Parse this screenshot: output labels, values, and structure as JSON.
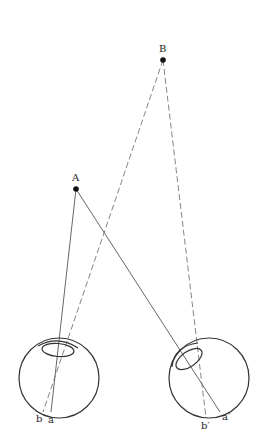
{
  "diagram": {
    "type": "binocular-vision-geometry",
    "points": {
      "A": {
        "label": "A",
        "x": 76,
        "y": 189
      },
      "B": {
        "label": "B",
        "x": 163,
        "y": 60
      }
    },
    "eyes": {
      "left": {
        "center": [
          59,
          378
        ],
        "radius": 40,
        "pupil": {
          "cx": 58,
          "cy": 349,
          "rx": 17,
          "ry": 7,
          "rotate": 5
        },
        "retina_labels": {
          "b": "b",
          "a": "a"
        }
      },
      "right": {
        "center": [
          209,
          378
        ],
        "radius": 40,
        "pupil": {
          "cx": 190,
          "cy": 359,
          "rx": 16,
          "ry": 8,
          "rotate": -35
        },
        "retina_labels": {
          "b": "b′",
          "a": "a′"
        }
      }
    },
    "lines": [
      {
        "from": "A",
        "to": "a",
        "style": "solid"
      },
      {
        "from": "A",
        "to": "a′",
        "style": "solid"
      },
      {
        "from": "B",
        "to": "b",
        "style": "dashed"
      },
      {
        "from": "B",
        "to": "b′",
        "style": "dashed"
      }
    ],
    "colors": {
      "stroke": "#333333",
      "dashed": "#666666",
      "background": "#ffffff"
    }
  }
}
